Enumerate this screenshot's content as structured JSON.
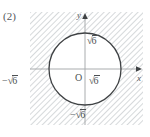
{
  "figure": {
    "part_label": "(2)",
    "axes": {
      "x_axis_label": "x",
      "y_axis_label": "y",
      "origin_label": "O"
    },
    "value_labels": {
      "y_positive": {
        "sign": "",
        "radical": "√",
        "radicand": "6"
      },
      "y_negative": {
        "sign": "−",
        "radical": "√",
        "radicand": "6"
      },
      "x_positive": {
        "sign": "",
        "radical": "√",
        "radicand": "6"
      },
      "x_negative": {
        "sign": "−",
        "radical": "√",
        "radicand": "6"
      }
    },
    "circle": {
      "center_x": 55,
      "center_y": 57,
      "radius": 36,
      "stroke_color": "#3f4244",
      "fill_color": "#ffffff"
    },
    "hatching": {
      "color": "#c9cccf",
      "angle_degrees": 45,
      "spacing_px": 4,
      "region": "outside-circle"
    },
    "box": {
      "left": 30,
      "top": 12,
      "width": 113,
      "height": 113
    },
    "axis_color": "#a9acae",
    "text_color": "#4d5052"
  }
}
